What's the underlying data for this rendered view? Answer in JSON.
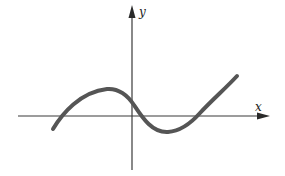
{
  "diagram": {
    "type": "function-graph",
    "axes": {
      "x_label": "x",
      "y_label": "y"
    },
    "curve": {
      "shape": "cubic",
      "x_intercepts": 3,
      "local_max_position": "left of y-axis, above x-axis",
      "local_min_position": "right of y-axis, below x-axis",
      "y_intercept_sign": "positive"
    },
    "colors": {
      "curve": "#555555",
      "axes": "#3a3a3a",
      "background": "#ffffff"
    }
  }
}
